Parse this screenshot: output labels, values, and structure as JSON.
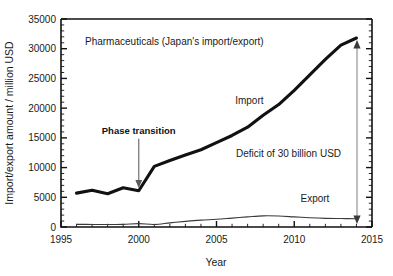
{
  "chart_data": {
    "type": "line",
    "title": "Pharmaceuticals (Japan's import/export)",
    "xlabel": "Year",
    "ylabel": "Import/export amount / million USD",
    "xlim": [
      1995,
      2015
    ],
    "ylim": [
      0,
      35000
    ],
    "grid": false,
    "legend_position": "inline-labels",
    "x_ticks": [
      1995,
      2000,
      2005,
      2010,
      2015
    ],
    "x_tick_labels": [
      "1995",
      "2000",
      "2005",
      "2010",
      "2015"
    ],
    "x_minor_step": 1,
    "y_ticks": [
      0,
      5000,
      10000,
      15000,
      20000,
      25000,
      30000,
      35000
    ],
    "y_tick_labels": [
      "0",
      "5000",
      "10000",
      "15000",
      "20000",
      "25000",
      "30000",
      "35000"
    ],
    "y_minor_step": 1000,
    "x": [
      1996,
      1997,
      1998,
      1999,
      2000,
      2001,
      2002,
      2003,
      2004,
      2005,
      2006,
      2007,
      2008,
      2009,
      2010,
      2011,
      2012,
      2013,
      2014
    ],
    "series": [
      {
        "name": "Import",
        "label": "Import",
        "color": "#111111",
        "values": [
          5700,
          6200,
          5600,
          6600,
          6100,
          10200,
          11200,
          12100,
          13000,
          14200,
          15400,
          16800,
          18800,
          20600,
          23000,
          25600,
          28200,
          30600,
          31800
        ]
      },
      {
        "name": "Export",
        "label": "Export",
        "color": "#3a3a3a",
        "values": [
          450,
          430,
          430,
          440,
          560,
          430,
          700,
          950,
          1150,
          1300,
          1500,
          1700,
          1880,
          1850,
          1700,
          1550,
          1450,
          1420,
          1400
        ]
      }
    ],
    "annotations": [
      {
        "name": "phase-transition",
        "text": "Phase transition",
        "bold": true,
        "x": 2000,
        "y": 15000,
        "arrow_to_x": 2000,
        "arrow_to_y": 6400
      },
      {
        "name": "import-label",
        "text": "Import",
        "bold": false,
        "x": 2006.2,
        "y": 20700
      },
      {
        "name": "export-label",
        "text": "Export",
        "bold": false,
        "x": 2010.4,
        "y": 4200
      },
      {
        "name": "deficit-label",
        "text": "Deficit of 30 billion USD",
        "bold": false,
        "x": 2007.6,
        "y": 13100
      },
      {
        "name": "deficit-span",
        "text": "",
        "x": 2014,
        "y_top": 31200,
        "y_bottom": 1500
      }
    ]
  }
}
